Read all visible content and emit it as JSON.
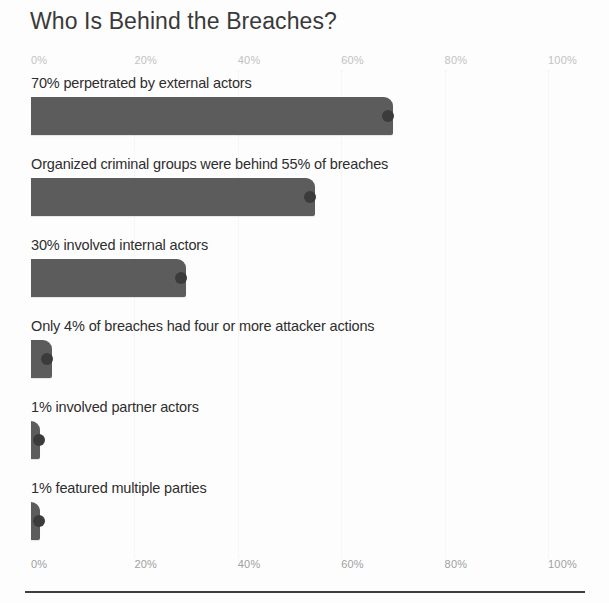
{
  "chart_data": {
    "type": "bar",
    "orientation": "horizontal",
    "title": "Who Is Behind the Breaches?",
    "xlabel": "",
    "ylabel": "",
    "xlim": [
      0,
      100
    ],
    "grid": true,
    "legend": null,
    "tick_labels": [
      "0%",
      "20%",
      "40%",
      "60%",
      "80%",
      "100%"
    ],
    "tick_values": [
      0,
      20,
      40,
      60,
      80,
      100
    ],
    "axis_top": true,
    "axis_bottom": true,
    "categories": [
      "70% perpetrated by external actors",
      "Organized criminal groups were behind 55% of breaches",
      "30% involved internal actors",
      "Only 4% of breaches had four or more attacker actions",
      "1% involved partner actors",
      "1% featured multiple parties"
    ],
    "values": [
      70,
      55,
      30,
      4,
      1,
      1
    ],
    "bar_color": "#5c5c5c",
    "marker_color": "#3b3b3b",
    "title_color": "#3a3a3a",
    "label_color": "#2e2e2e",
    "tick_color_top": "#c2c2c2",
    "tick_color_bottom": "#a0a0a0",
    "rule_color": "#3f3f3f"
  }
}
